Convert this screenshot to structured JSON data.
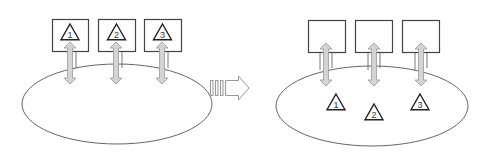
{
  "diagram": {
    "colors": {
      "stroke": "#444444",
      "ellipse_stroke": "#666666",
      "arrow_fill": "#d4d4d4",
      "arrow_stroke": "#999999",
      "background": "#ffffff"
    },
    "before": {
      "boxes": [
        {
          "x": 52,
          "y": 19,
          "w": 36,
          "h": 32,
          "label": "1"
        },
        {
          "x": 98,
          "y": 19,
          "w": 37,
          "h": 32,
          "label": "2"
        },
        {
          "x": 144,
          "y": 19,
          "w": 37,
          "h": 32,
          "label": "3"
        }
      ],
      "ellipse": {
        "cx": 117,
        "cy": 104,
        "rx": 95,
        "ry": 40
      },
      "arrows": [
        {
          "x": 70,
          "y1": 42,
          "y2": 84
        },
        {
          "x": 116,
          "y1": 42,
          "y2": 84
        },
        {
          "x": 162,
          "y1": 42,
          "y2": 84
        }
      ]
    },
    "transition": {
      "icon": "right-arrow-icon"
    },
    "after": {
      "boxes": [
        {
          "x": 308,
          "y": 20,
          "w": 37,
          "h": 32
        },
        {
          "x": 355,
          "y": 20,
          "w": 37,
          "h": 32
        },
        {
          "x": 402,
          "y": 20,
          "w": 37,
          "h": 32
        }
      ],
      "ellipse": {
        "cx": 372,
        "cy": 106,
        "rx": 96,
        "ry": 40
      },
      "arrows": [
        {
          "x": 326,
          "y1": 43,
          "y2": 86
        },
        {
          "x": 374,
          "y1": 43,
          "y2": 86
        },
        {
          "x": 421,
          "y1": 43,
          "y2": 86
        }
      ],
      "triangles": [
        {
          "cx": 336,
          "cy": 103,
          "label": "1"
        },
        {
          "cx": 374,
          "cy": 113,
          "label": "2"
        },
        {
          "cx": 420,
          "cy": 103,
          "label": "3"
        }
      ]
    }
  }
}
